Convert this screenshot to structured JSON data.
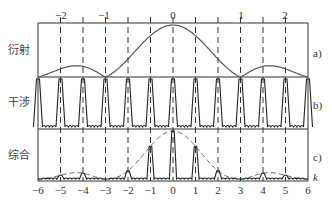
{
  "figure": {
    "panels": [
      {
        "id": "a",
        "label": "衍射",
        "tag": "a)"
      },
      {
        "id": "b",
        "label": "干涉",
        "tag": "b)"
      },
      {
        "id": "c",
        "label": "综合",
        "tag": "c)"
      }
    ],
    "top_axis": {
      "ticks": [
        {
          "label": "−2",
          "k": -5
        },
        {
          "label": "−1",
          "k": -3
        },
        {
          "label": "0",
          "k": 0
        },
        {
          "label": "1",
          "k": 3
        },
        {
          "label": "2",
          "k": 5
        }
      ]
    },
    "bottom_axis": {
      "ticks": [
        "−6",
        "−5",
        "−4",
        "−3",
        "−2",
        "−1",
        "0",
        "1",
        "2",
        "3",
        "4",
        "5",
        "6"
      ],
      "variable": "k"
    },
    "dashed_lines_k": [
      -5,
      -4,
      -3,
      -2,
      -1,
      0,
      1,
      2,
      3,
      4,
      5
    ],
    "colors": {
      "line": "#333333",
      "envelope": "#666666",
      "background": "#ffffff"
    }
  }
}
